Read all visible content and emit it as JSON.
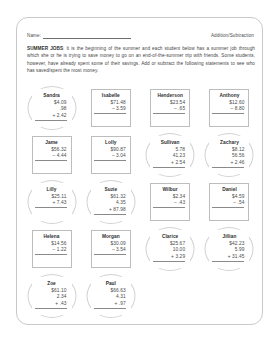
{
  "header": {
    "name_label": "Name:",
    "subject_label": "Addition/Subtraction"
  },
  "intro": {
    "title": "SUMMER JOBS",
    "body": ": It is the beginning of the summer and each student below has a summer job through which she or he is trying to save money to go on an end-of-the-summer trip with friends. Some students, however, have already spent some of their savings. Add or subtract the following statements to see who has saved/spent the most money."
  },
  "problems": [
    [
      {
        "name": "Sandra",
        "lines": [
          "$4.09",
          ".98"
        ],
        "op": "+ 2.42",
        "circled": true
      },
      {
        "name": "Isabelle",
        "lines": [
          "$71.48"
        ],
        "op": "– 3.59",
        "circled": false
      },
      {
        "name": "Henderson",
        "lines": [
          "$23.54"
        ],
        "op": "– .65",
        "circled": false
      },
      {
        "name": "Anthony",
        "lines": [
          "$12.60"
        ],
        "op": "– 8.80",
        "circled": false
      }
    ],
    [
      {
        "name": "Jame",
        "lines": [
          "$56.32"
        ],
        "op": "– 4.44",
        "circled": false
      },
      {
        "name": "Lolly",
        "lines": [
          "$90.87"
        ],
        "op": "– 3.04",
        "circled": false
      },
      {
        "name": "Sullivan",
        "lines": [
          "5.78",
          "41.23"
        ],
        "op": "+ 2.54",
        "circled": true
      },
      {
        "name": "Zachary",
        "lines": [
          "$8.12",
          "56.56"
        ],
        "op": "+ 2.46",
        "circled": true
      }
    ],
    [
      {
        "name": "Lilly",
        "lines": [
          "$25.11"
        ],
        "op": "+ 7.43",
        "circled": true
      },
      {
        "name": "Suzie",
        "lines": [
          "$61.32",
          "4.35"
        ],
        "op": "+ 87.98",
        "circled": true
      },
      {
        "name": "Wilbur",
        "lines": [
          "$2.34"
        ],
        "op": "– .43",
        "circled": false
      },
      {
        "name": "Daniel",
        "lines": [
          "$4.59"
        ],
        "op": "– .54",
        "circled": false
      }
    ],
    [
      {
        "name": "Helena",
        "lines": [
          "$14.56"
        ],
        "op": "– 1.22",
        "circled": false
      },
      {
        "name": "Morgan",
        "lines": [
          "$30.09"
        ],
        "op": "– 3.54",
        "circled": false
      },
      {
        "name": "Clarice",
        "lines": [
          "$25.67",
          "10.00"
        ],
        "op": "+ 3.29",
        "circled": true
      },
      {
        "name": "Jillian",
        "lines": [
          "$42.23",
          "5.99"
        ],
        "op": "+ 31.45",
        "circled": true
      }
    ],
    [
      {
        "name": "Zoe",
        "lines": [
          "$61.10",
          "2.34"
        ],
        "op": "+ .43",
        "circled": true
      },
      {
        "name": "Paul",
        "lines": [
          "$66.63",
          "4.31"
        ],
        "op": "+ .97",
        "circled": true
      },
      {
        "name": "",
        "lines": [],
        "op": "",
        "circled": false,
        "empty": true
      },
      {
        "name": "",
        "lines": [],
        "op": "",
        "circled": false,
        "empty": true
      }
    ]
  ]
}
